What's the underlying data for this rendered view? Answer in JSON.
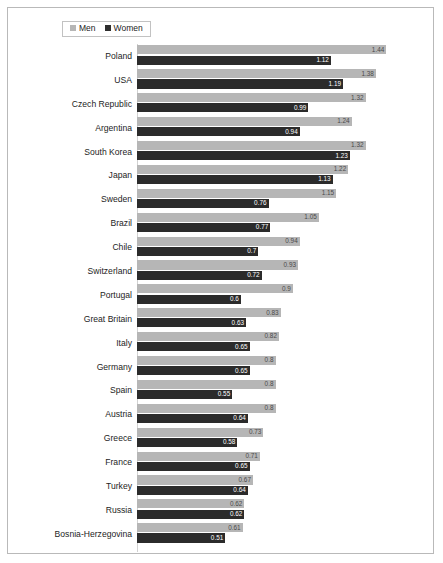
{
  "legend": {
    "items": [
      {
        "label": "Men",
        "color": "#b6b6b6",
        "icon": "square-swatch-icon"
      },
      {
        "label": "Women",
        "color": "#2b2b2b",
        "icon": "square-swatch-icon"
      }
    ]
  },
  "chart_data": {
    "type": "bar",
    "orientation": "horizontal",
    "title": "",
    "subtitle": "",
    "xlabel": "",
    "ylabel": "",
    "xlim": [
      0,
      1.6
    ],
    "grid": false,
    "legend_position": "top-left",
    "sorted_by": "Men descending",
    "categories": [
      "Poland",
      "USA",
      "Czech Republic",
      "Argentina",
      "South Korea",
      "Japan",
      "Sweden",
      "Brazil",
      "Chile",
      "Switzerland",
      "Portugal",
      "Great Britain",
      "Italy",
      "Germany",
      "Spain",
      "Austria",
      "Greece",
      "France",
      "Turkey",
      "Russia",
      "Bosnia-Herzegovina"
    ],
    "series": [
      {
        "name": "Men",
        "color": "#b6b6b6",
        "values": [
          1.44,
          1.38,
          1.32,
          1.24,
          1.32,
          1.22,
          1.15,
          1.05,
          0.94,
          0.93,
          0.9,
          0.83,
          0.82,
          0.8,
          0.8,
          0.8,
          0.73,
          0.71,
          0.67,
          0.62,
          0.61
        ],
        "labels": [
          "1.44",
          "1.38",
          "1.32",
          "1.24",
          "1.32",
          "1.22",
          "1.15",
          "1.05",
          "0.94",
          "0.93",
          "0.9",
          "0.83",
          "0.82",
          "0.8",
          "0.8",
          "0.8",
          "0.73",
          "0.71",
          "0.67",
          "0.62",
          "0.61"
        ]
      },
      {
        "name": "Women",
        "color": "#2b2b2b",
        "values": [
          1.12,
          1.19,
          0.99,
          0.94,
          1.23,
          1.13,
          0.76,
          0.77,
          0.7,
          0.72,
          0.6,
          0.63,
          0.65,
          0.65,
          0.55,
          0.64,
          0.58,
          0.65,
          0.64,
          0.62,
          0.51
        ],
        "labels": [
          "1.12",
          "1.19",
          "0.99",
          "0.94",
          "1.23",
          "1.13",
          "0.76",
          "0.77",
          "0.7",
          "0.72",
          "0.6",
          "0.63",
          "0.65",
          "0.65",
          "0.55",
          "0.64",
          "0.58",
          "0.65",
          "0.64",
          "0.62",
          "0.51"
        ]
      }
    ]
  }
}
